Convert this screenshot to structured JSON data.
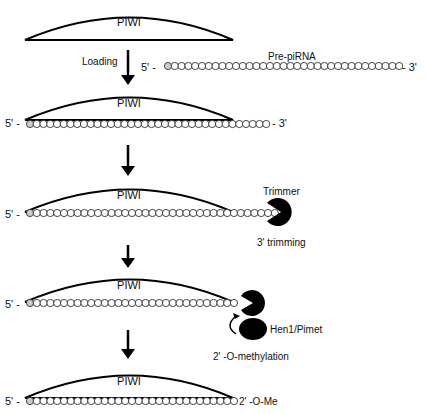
{
  "protein_label": "PIWI",
  "steps": [
    {
      "id": "pre-loading",
      "piwi": "PIWI"
    },
    {
      "id": "loaded",
      "piwi": "PIWI",
      "end5": "5' -",
      "end3": "- 3'"
    },
    {
      "id": "trimming",
      "piwi": "PIWI",
      "end5": "5' -",
      "enzyme": "Trimmer",
      "process": "3' trimming"
    },
    {
      "id": "methylation",
      "piwi": "PIWI",
      "end5": "5' -",
      "enzyme": "Hen1/Pimet",
      "process": "2' -O-methylation"
    },
    {
      "id": "mature",
      "piwi": "PIWI",
      "end5": "5' -",
      "end3": "2' -O-Me"
    }
  ],
  "arrows": [
    {
      "label": "Loading"
    },
    {
      "label": ""
    },
    {
      "label": ""
    },
    {
      "label": ""
    }
  ],
  "pre_pirna": {
    "label": "Pre-piRNA",
    "end5": "5' -",
    "end3": "- 3'"
  },
  "colors": {
    "line": "#111111",
    "background": "#ffffff",
    "enzyme": "#000000"
  }
}
